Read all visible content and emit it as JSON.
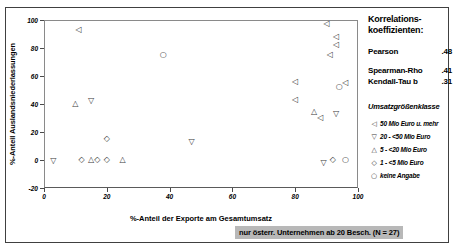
{
  "chart_data": {
    "type": "scatter",
    "title": "",
    "xlabel": "%-Anteil der Exporte am Gesamtumsatz",
    "ylabel": "%-Anteil Auslandsniederlassungen",
    "xlim": [
      0,
      100
    ],
    "ylim": [
      -20,
      100
    ],
    "xticks": [
      0,
      20,
      40,
      60,
      80,
      100
    ],
    "yticks": [
      -20,
      0,
      20,
      40,
      60,
      80,
      100
    ],
    "grid": false,
    "legend_position": "right",
    "note": "nur österr. Unternehmen ab 20 Besch. (N = 27)",
    "series": [
      {
        "name": "50 Mio Euro u. mehr",
        "marker": "left-triangle",
        "glyph": "◁",
        "points": [
          {
            "x": 11,
            "y": 93
          },
          {
            "x": 80,
            "y": 56
          },
          {
            "x": 80,
            "y": 43
          },
          {
            "x": 88,
            "y": 30
          },
          {
            "x": 90,
            "y": 97
          },
          {
            "x": 93,
            "y": 88
          },
          {
            "x": 93,
            "y": 82
          },
          {
            "x": 91,
            "y": 75
          },
          {
            "x": 96,
            "y": 55
          }
        ]
      },
      {
        "name": "20 - <50 Mio Euro",
        "marker": "down-triangle",
        "glyph": "▽",
        "points": [
          {
            "x": 3,
            "y": -1
          },
          {
            "x": 15,
            "y": 42
          },
          {
            "x": 47,
            "y": 13
          },
          {
            "x": 93,
            "y": 33
          },
          {
            "x": 89,
            "y": -2
          }
        ]
      },
      {
        "name": "5 - <20 Mio Euro",
        "marker": "up-triangle",
        "glyph": "△",
        "points": [
          {
            "x": 10,
            "y": 40
          },
          {
            "x": 15,
            "y": 0
          },
          {
            "x": 25,
            "y": 0
          },
          {
            "x": 86,
            "y": 34
          }
        ]
      },
      {
        "name": "1 - <5 Mio Euro",
        "marker": "diamond",
        "glyph": "◇",
        "points": [
          {
            "x": 12,
            "y": 0
          },
          {
            "x": 17,
            "y": 0
          },
          {
            "x": 20,
            "y": 0
          },
          {
            "x": 20,
            "y": 15
          },
          {
            "x": 92,
            "y": 0
          }
        ]
      },
      {
        "name": "keine Angabe",
        "marker": "circle",
        "glyph": "○",
        "points": [
          {
            "x": 38,
            "y": 75
          },
          {
            "x": 96,
            "y": 0
          },
          {
            "x": 94,
            "y": 52
          }
        ]
      }
    ]
  },
  "axes": {
    "y_title": "%-Anteil Auslandsniederlassungen",
    "x_title": "%-Anteil der Exporte am Gesamtumsatz",
    "y_tick_labels": [
      "100",
      "80",
      "60",
      "40",
      "20",
      "0",
      "-20"
    ],
    "x_tick_labels": [
      "0",
      "20",
      "40",
      "60",
      "80",
      "100"
    ]
  },
  "correlations": {
    "title_line1": "Korrelations-",
    "title_line2": "koeffizienten:",
    "rows": [
      {
        "label": "Pearson",
        "value": ".48"
      },
      {
        "label": "Spearman-Rho",
        "value": ".41"
      },
      {
        "label": "Kendall-Tau b",
        "value": ".31"
      }
    ]
  },
  "legend": {
    "title": "Umsatzgrößenklasse",
    "items": [
      {
        "glyph": "◁",
        "label": "50 Mio Euro u. mehr"
      },
      {
        "glyph": "▽",
        "label": "20 - <50 Mio Euro"
      },
      {
        "glyph": "△",
        "label": "5 - <20 Mio Euro"
      },
      {
        "glyph": "◇",
        "label": "1 -  <5 Mio Euro"
      },
      {
        "glyph": "○",
        "label": "keine Angabe"
      }
    ]
  },
  "caption": {
    "text": "nur österr. Unternehmen ab 20 Besch. (N = 27)",
    "background": "#b8b8b8"
  }
}
